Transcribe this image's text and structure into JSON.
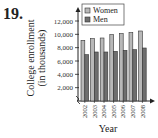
{
  "problem_number": "19.",
  "chart_data": {
    "type": "bar",
    "title": "",
    "xlabel": "Year",
    "ylabel": "College enrollment (in thousands)",
    "ylabel_lines": [
      "College enrollment",
      "(in thousands)"
    ],
    "categories": [
      "2002",
      "2003",
      "2004",
      "2005",
      "2006",
      "2007",
      "2008"
    ],
    "series": [
      {
        "name": "Women",
        "color": "#b8b8b8",
        "values": [
          9100,
          9350,
          9450,
          9950,
          10100,
          10250,
          10500
        ]
      },
      {
        "name": "Men",
        "color": "#6e6e6e",
        "values": [
          6950,
          7350,
          7350,
          7450,
          7600,
          7700,
          7950
        ]
      }
    ],
    "ylim": [
      0,
      12000
    ],
    "yticks": [
      2000,
      4000,
      6000,
      8000,
      10000,
      12000
    ],
    "ytick_labels": [
      "2,000",
      "4,000",
      "6,000",
      "8,000",
      "10,000",
      "12,000"
    ],
    "legend": {
      "position": "top-left inside",
      "entries": [
        "Women",
        "Men"
      ]
    },
    "grid": false,
    "axis_break": true
  }
}
